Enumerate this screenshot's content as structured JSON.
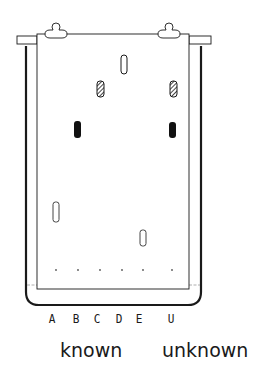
{
  "figure": {
    "lanes": [
      {
        "id": "A",
        "label": "A",
        "x": 56
      },
      {
        "id": "B",
        "label": "B",
        "x": 78
      },
      {
        "id": "C",
        "label": "C",
        "x": 100
      },
      {
        "id": "D",
        "label": "D",
        "x": 122
      },
      {
        "id": "E",
        "label": "E",
        "x": 143
      },
      {
        "id": "U",
        "label": "U",
        "x": 172
      }
    ],
    "groups": {
      "known": "known",
      "unknown": "unknown"
    },
    "spots": [
      {
        "lane": "D",
        "style": "outline",
        "x": 124,
        "y": 64
      },
      {
        "lane": "C",
        "style": "hatched",
        "x": 100,
        "y": 89
      },
      {
        "lane": "U",
        "style": "hatched",
        "x": 173,
        "y": 89
      },
      {
        "lane": "B",
        "style": "solid",
        "x": 78,
        "y": 129
      },
      {
        "lane": "U",
        "style": "solid",
        "x": 173,
        "y": 129
      },
      {
        "lane": "A",
        "style": "outline",
        "x": 56,
        "y": 212
      },
      {
        "lane": "E",
        "style": "outline",
        "x": 143,
        "y": 238
      }
    ],
    "colors": {
      "ink": "#1a1a1a",
      "background": "#ffffff"
    }
  }
}
